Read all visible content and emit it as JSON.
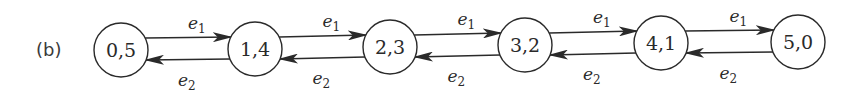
{
  "panel_label": "(b)",
  "colors": {
    "stroke": "#2a2a2a",
    "background": "#ffffff"
  },
  "nodes": [
    {
      "id": "n0",
      "label": "0,5",
      "cx": 121,
      "cy": 50,
      "r": 27
    },
    {
      "id": "n1",
      "label": "1,4",
      "cx": 255,
      "cy": 49,
      "r": 27
    },
    {
      "id": "n2",
      "label": "2,3",
      "cx": 390,
      "cy": 47,
      "r": 27
    },
    {
      "id": "n3",
      "label": "3,2",
      "cx": 525,
      "cy": 45,
      "r": 27
    },
    {
      "id": "n4",
      "label": "4,1",
      "cx": 661,
      "cy": 43,
      "r": 27
    },
    {
      "id": "n5",
      "label": "5,0",
      "cx": 798,
      "cy": 42,
      "r": 27
    }
  ],
  "edges": [
    {
      "from": "n0",
      "to": "n1",
      "label": "e",
      "sub": "1",
      "direction": "forward"
    },
    {
      "from": "n1",
      "to": "n0",
      "label": "e",
      "sub": "2",
      "direction": "backward"
    },
    {
      "from": "n1",
      "to": "n2",
      "label": "e",
      "sub": "1",
      "direction": "forward"
    },
    {
      "from": "n2",
      "to": "n1",
      "label": "e",
      "sub": "2",
      "direction": "backward"
    },
    {
      "from": "n2",
      "to": "n3",
      "label": "e",
      "sub": "1",
      "direction": "forward"
    },
    {
      "from": "n3",
      "to": "n2",
      "label": "e",
      "sub": "2",
      "direction": "backward"
    },
    {
      "from": "n3",
      "to": "n4",
      "label": "e",
      "sub": "1",
      "direction": "forward"
    },
    {
      "from": "n4",
      "to": "n3",
      "label": "e",
      "sub": "2",
      "direction": "backward"
    },
    {
      "from": "n4",
      "to": "n5",
      "label": "e",
      "sub": "1",
      "direction": "forward"
    },
    {
      "from": "n5",
      "to": "n4",
      "label": "e",
      "sub": "2",
      "direction": "backward"
    }
  ]
}
